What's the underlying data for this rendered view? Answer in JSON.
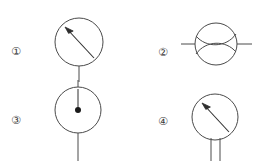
{
  "figure": {
    "background_color": "#ffffff",
    "stroke_color": "#4a4a4a",
    "label_color": "#3a3a3a",
    "width": 272,
    "height": 161
  },
  "items": [
    {
      "label": "①",
      "name": "symbol-1",
      "description": "circle meter with diagonal needle pointing upper-left and single vertical lead below",
      "label_x": 16,
      "label_y": 52,
      "circle": {
        "cx": 79,
        "cy": 42,
        "r": 24
      },
      "needle": {
        "x1": 94,
        "y1": 58,
        "x2": 65,
        "y2": 27
      },
      "leads": [
        {
          "x1": 79,
          "y1": 66,
          "x2": 79,
          "y2": 82
        }
      ]
    },
    {
      "label": "②",
      "name": "symbol-2",
      "description": "circle with two crossing S-curves and horizontal leads on both sides",
      "label_x": 163,
      "label_y": 53,
      "circle": {
        "cx": 216,
        "cy": 44,
        "r": 21
      },
      "leads": [
        {
          "x1": 181,
          "y1": 44,
          "x2": 195,
          "y2": 44
        },
        {
          "x1": 237,
          "y1": 44,
          "x2": 252,
          "y2": 44
        }
      ],
      "curves": [
        "M 196 36 C 206 48, 226 48, 236 34",
        "M 196 54 C 206 40, 226 40, 236 52"
      ]
    },
    {
      "label": "③",
      "name": "symbol-3",
      "description": "circle meter with vertical needle to a filled center dot, leads above and below",
      "label_x": 16,
      "label_y": 121,
      "circle": {
        "cx": 78,
        "cy": 110,
        "r": 23
      },
      "needle": {
        "x1": 78,
        "y1": 89,
        "x2": 78,
        "y2": 110
      },
      "dot": {
        "cx": 78,
        "cy": 110,
        "r": 3
      },
      "leads": [
        {
          "x1": 78,
          "y1": 80,
          "x2": 78,
          "y2": 87
        },
        {
          "x1": 78,
          "y1": 133,
          "x2": 78,
          "y2": 161
        }
      ]
    },
    {
      "label": "④",
      "name": "symbol-4",
      "description": "circle meter with diagonal needle pointing upper-left and two parallel leads below",
      "label_x": 163,
      "label_y": 122,
      "circle": {
        "cx": 215,
        "cy": 117,
        "r": 23
      },
      "needle": {
        "x1": 229,
        "y1": 132,
        "x2": 202,
        "y2": 103
      },
      "leads": [
        {
          "x1": 211,
          "y1": 138,
          "x2": 211,
          "y2": 161
        },
        {
          "x1": 220,
          "y1": 138,
          "x2": 220,
          "y2": 161
        }
      ]
    }
  ]
}
